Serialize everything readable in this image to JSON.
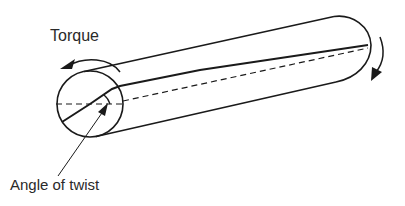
{
  "diagram": {
    "labels": {
      "torque": "Torque",
      "angle": "Angle of twist"
    },
    "colors": {
      "line": "#1a1a1a",
      "background": "#ffffff"
    }
  }
}
